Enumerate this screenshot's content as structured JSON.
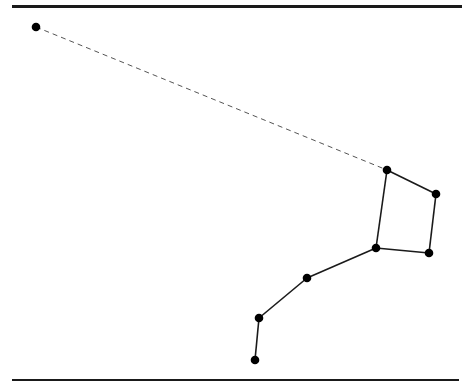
{
  "diagram": {
    "type": "star-constellation",
    "width": 474,
    "height": 391,
    "colors": {
      "line": "#1a1a1a",
      "star": "#000000",
      "background": "#ffffff"
    },
    "rules": [
      {
        "name": "top-rule",
        "x": 12,
        "y": 5,
        "width": 450,
        "height": 3
      },
      {
        "name": "bottom-rule",
        "x": 12,
        "y": 379,
        "width": 447,
        "height": 2
      }
    ],
    "stars": [
      {
        "id": "s0",
        "x": 36,
        "y": 27
      },
      {
        "id": "s1",
        "x": 387,
        "y": 170
      },
      {
        "id": "s2",
        "x": 436,
        "y": 194
      },
      {
        "id": "s3",
        "x": 429,
        "y": 253
      },
      {
        "id": "s4",
        "x": 376,
        "y": 248
      },
      {
        "id": "s5",
        "x": 307,
        "y": 278
      },
      {
        "id": "s6",
        "x": 259,
        "y": 318
      },
      {
        "id": "s7",
        "x": 255,
        "y": 360
      }
    ],
    "edges": [
      {
        "from": "s0",
        "to": "s1",
        "style": "dashed"
      },
      {
        "from": "s1",
        "to": "s2",
        "style": "solid"
      },
      {
        "from": "s2",
        "to": "s3",
        "style": "solid"
      },
      {
        "from": "s3",
        "to": "s4",
        "style": "solid"
      },
      {
        "from": "s4",
        "to": "s1",
        "style": "solid"
      },
      {
        "from": "s4",
        "to": "s5",
        "style": "solid"
      },
      {
        "from": "s5",
        "to": "s6",
        "style": "solid"
      },
      {
        "from": "s6",
        "to": "s7",
        "style": "solid"
      }
    ]
  }
}
